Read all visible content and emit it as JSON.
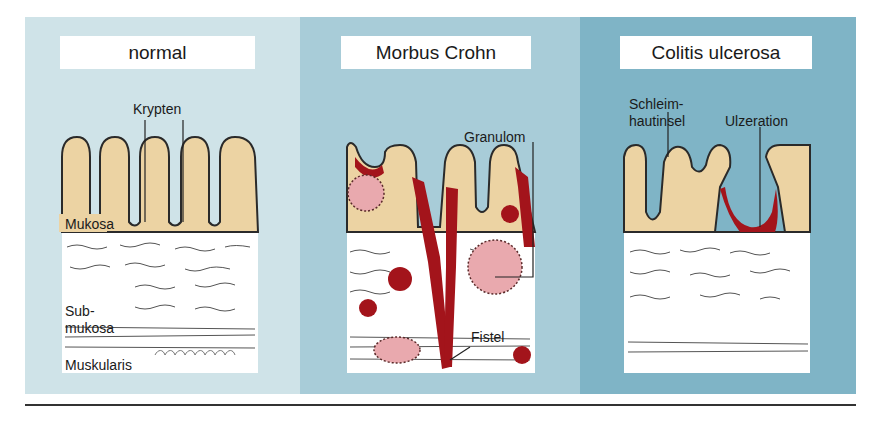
{
  "figure": {
    "panels": [
      {
        "title": "normal",
        "labels": {
          "crypts": "Krypten",
          "mucosa": "Mukosa",
          "submucosa_1": "Sub-",
          "submucosa_2": "mukosa",
          "muscularis": "Muskularis"
        },
        "background": "#cfe3e8"
      },
      {
        "title": "Morbus Crohn",
        "labels": {
          "granuloma": "Granulom",
          "fistula": "Fistel"
        },
        "background": "#a8ccd8"
      },
      {
        "title": "Colitis ulcerosa",
        "labels": {
          "mucosal_island_1": "Schleim-",
          "mucosal_island_2": "hautinsel",
          "ulceration": "Ulzeration"
        },
        "background": "#7fb4c6"
      }
    ],
    "colors": {
      "mucosa": "#ecd3a3",
      "submucosa": "#ffffff",
      "inflammation": "#a3141b",
      "granuloma": "#e9a9ae",
      "outline": "#2a2a2a"
    }
  }
}
